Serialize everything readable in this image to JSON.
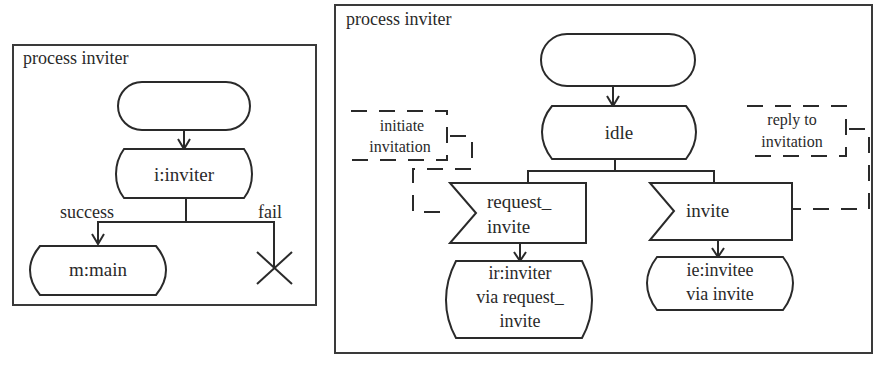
{
  "left_diagram": {
    "title": "process inviter",
    "start_label": "",
    "state_i_inviter": "i:inviter",
    "branch_success": "success",
    "branch_fail": "fail",
    "state_m_main": "m:main"
  },
  "right_diagram": {
    "title": "process inviter",
    "start_label": "",
    "state_idle": "idle",
    "input_request_invite": {
      "line1": "request_",
      "line2": "invite"
    },
    "input_invite": "invite",
    "state_ir_inviter": {
      "line1": "ir:inviter",
      "line2": "via request_",
      "line3": "invite"
    },
    "state_ie_invitee": {
      "line1": "ie:invitee",
      "line2": "via invite"
    },
    "comment_initiate": {
      "line1": "initiate",
      "line2": "invitation"
    },
    "comment_reply": {
      "line1": "reply to",
      "line2": "invitation"
    }
  },
  "colors": {
    "stroke": "#2a2a2a",
    "background": "#ffffff"
  }
}
